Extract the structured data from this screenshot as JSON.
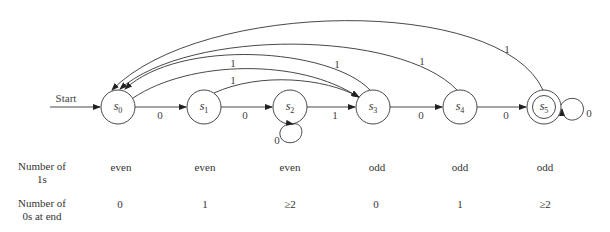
{
  "diagram": {
    "start_label": "Start",
    "states": [
      {
        "id": "s0",
        "name": "s",
        "sub": "0",
        "accepting": false
      },
      {
        "id": "s1",
        "name": "s",
        "sub": "1",
        "accepting": false
      },
      {
        "id": "s2",
        "name": "s",
        "sub": "2",
        "accepting": false
      },
      {
        "id": "s3",
        "name": "s",
        "sub": "3",
        "accepting": false
      },
      {
        "id": "s4",
        "name": "s",
        "sub": "4",
        "accepting": false
      },
      {
        "id": "s5",
        "name": "s",
        "sub": "5",
        "accepting": true
      }
    ],
    "transitions": [
      {
        "from": "s0",
        "to": "s1",
        "label": "0"
      },
      {
        "from": "s1",
        "to": "s2",
        "label": "0"
      },
      {
        "from": "s2",
        "to": "s2",
        "label": "0"
      },
      {
        "from": "s2",
        "to": "s3",
        "label": "1"
      },
      {
        "from": "s3",
        "to": "s4",
        "label": "0"
      },
      {
        "from": "s4",
        "to": "s5",
        "label": "0"
      },
      {
        "from": "s5",
        "to": "s5",
        "label": "0"
      },
      {
        "from": "s0",
        "to": "s3",
        "label": "1"
      },
      {
        "from": "s1",
        "to": "s3",
        "label": "1"
      },
      {
        "from": "s3",
        "to": "s0",
        "label": "1"
      },
      {
        "from": "s4",
        "to": "s0",
        "label": "1"
      },
      {
        "from": "s5",
        "to": "s0",
        "label": "1"
      }
    ]
  },
  "table": {
    "rows": [
      {
        "header_line1": "Number of",
        "header_line2": "1s",
        "values": [
          "even",
          "even",
          "even",
          "odd",
          "odd",
          "odd"
        ]
      },
      {
        "header_line1": "Number of",
        "header_line2": "0s at end",
        "values": [
          "0",
          "1",
          "≥2",
          "0",
          "1",
          "≥2"
        ]
      }
    ]
  }
}
